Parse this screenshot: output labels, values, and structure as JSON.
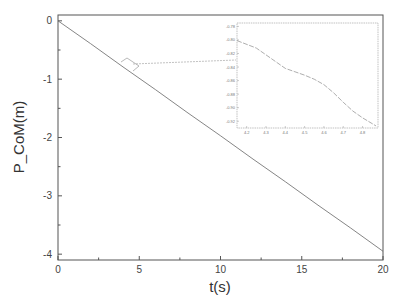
{
  "chart_data": {
    "type": "line",
    "title": "",
    "xlabel": "t(s)",
    "ylabel": "P_CoM(m)",
    "xlim": [
      0,
      20
    ],
    "ylim": [
      -4.1,
      0.1
    ],
    "xticks": [
      0,
      5,
      10,
      15,
      20
    ],
    "yticks": [
      0,
      -1,
      -2,
      -3,
      -4
    ],
    "grid": false,
    "legend": null,
    "series": [
      {
        "name": "P_CoM",
        "x": [
          0,
          2,
          4,
          6,
          8,
          10,
          12,
          14,
          16,
          18,
          20
        ],
        "y": [
          0,
          -0.39,
          -0.79,
          -1.18,
          -1.58,
          -1.97,
          -2.37,
          -2.76,
          -3.16,
          -3.55,
          -3.95
        ]
      }
    ],
    "inset": {
      "type": "line",
      "xlim": [
        4.15,
        4.88
      ],
      "ylim": [
        -0.93,
        -0.775
      ],
      "xticks": [
        "4.2",
        "4.3",
        "4.4",
        "4.5",
        "4.6",
        "4.7",
        "4.8"
      ],
      "yticks": [
        "-0.78",
        "-0.80",
        "-0.82",
        "-0.84",
        "-0.86",
        "-0.88",
        "-0.90",
        "-0.92"
      ],
      "series": [
        {
          "name": "P_CoM zoom",
          "x": [
            4.15,
            4.25,
            4.3,
            4.35,
            4.4,
            4.45,
            4.5,
            4.55,
            4.6,
            4.65,
            4.7,
            4.75,
            4.8,
            4.87
          ],
          "y": [
            -0.801,
            -0.812,
            -0.822,
            -0.832,
            -0.842,
            -0.847,
            -0.852,
            -0.858,
            -0.866,
            -0.878,
            -0.892,
            -0.905,
            -0.915,
            -0.927
          ]
        }
      ],
      "annotation": "zoomed region around t≈4.2–4.9 s, linked by arrow from main curve"
    }
  }
}
